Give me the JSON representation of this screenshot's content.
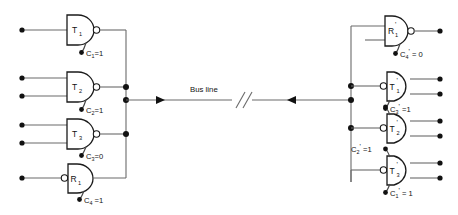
{
  "diagram": {
    "title": "Bus line",
    "bus": {
      "label": "Bus line",
      "break_symbol": "//",
      "left_arrow_direction": "right",
      "right_arrow_direction": "left"
    },
    "left_station": {
      "gates": [
        {
          "id": "left-gate-t1",
          "label": "T",
          "subscript": "1",
          "prime": "",
          "kind": "transmitter",
          "bubble_side": "output",
          "inputs": 1,
          "outputs": 1
        },
        {
          "id": "left-gate-t2",
          "label": "T",
          "subscript": "2",
          "prime": "",
          "kind": "transmitter",
          "bubble_side": "output",
          "inputs": 2,
          "outputs": 1
        },
        {
          "id": "left-gate-t3",
          "label": "T",
          "subscript": "3",
          "prime": "",
          "kind": "transmitter",
          "bubble_side": "output",
          "inputs": 2,
          "outputs": 1
        },
        {
          "id": "left-gate-r1",
          "label": "R",
          "subscript": "1",
          "prime": "",
          "kind": "receiver",
          "bubble_side": "input",
          "inputs": 1,
          "outputs": 1
        }
      ],
      "controls": [
        {
          "id": "left-ctrl-c1",
          "name": "C",
          "subscript": "1",
          "prime": "",
          "value": "1",
          "text": "C₁=1"
        },
        {
          "id": "left-ctrl-c2",
          "name": "C",
          "subscript": "2",
          "prime": "",
          "value": "1",
          "text": "C₂=1"
        },
        {
          "id": "left-ctrl-c3",
          "name": "C",
          "subscript": "3",
          "prime": "",
          "value": "0",
          "text": "C₃=0"
        },
        {
          "id": "left-ctrl-c4",
          "name": "C",
          "subscript": "4",
          "prime": "",
          "value": "1",
          "text": "C₄ =1"
        }
      ]
    },
    "right_station": {
      "gates": [
        {
          "id": "right-gate-r1",
          "label": "R",
          "subscript": "1",
          "prime": "'",
          "kind": "receiver",
          "bubble_side": "output",
          "inputs": 2,
          "outputs": 1
        },
        {
          "id": "right-gate-t1",
          "label": "T",
          "subscript": "1",
          "prime": "'",
          "kind": "transmitter",
          "bubble_side": "input",
          "inputs": 1,
          "outputs": 2
        },
        {
          "id": "right-gate-t2",
          "label": "T",
          "subscript": "2",
          "prime": "'",
          "kind": "transmitter",
          "bubble_side": "input",
          "inputs": 1,
          "outputs": 2
        },
        {
          "id": "right-gate-t3",
          "label": "T",
          "subscript": "3",
          "prime": "'",
          "kind": "transmitter",
          "bubble_side": "input",
          "inputs": 1,
          "outputs": 2
        }
      ],
      "controls": [
        {
          "id": "right-ctrl-c4",
          "name": "C",
          "subscript": "4",
          "prime": "'",
          "value": "0",
          "text": "C₄' = 0"
        },
        {
          "id": "right-ctrl-c3",
          "name": "C",
          "subscript": "3",
          "prime": "'",
          "value": "1",
          "text": "C₃' =1"
        },
        {
          "id": "right-ctrl-c2",
          "name": "C",
          "subscript": "2",
          "prime": "'",
          "value": "1",
          "text": "C₂' =1"
        },
        {
          "id": "right-ctrl-c1",
          "name": "C",
          "subscript": "1",
          "prime": "'",
          "value": "1",
          "text": "C₁' = 1"
        }
      ]
    },
    "colors": {
      "wire": "#6b6b6b",
      "gate_outline": "#1a1a1a",
      "dot": "#111111",
      "background": "#ffffff"
    }
  }
}
